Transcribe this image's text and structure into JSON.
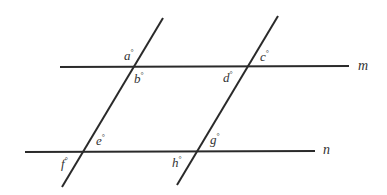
{
  "diagram": {
    "parallel_lines": [
      {
        "name": "m",
        "label": "m"
      },
      {
        "name": "n",
        "label": "n"
      }
    ],
    "transversals": [
      {
        "name": "left-transversal"
      },
      {
        "name": "right-transversal"
      }
    ],
    "angles": [
      {
        "label": "a",
        "unit": "°",
        "intersection": "left-transversal ∩ m",
        "position": "above-left"
      },
      {
        "label": "b",
        "unit": "°",
        "intersection": "left-transversal ∩ m",
        "position": "below-right"
      },
      {
        "label": "c",
        "unit": "°",
        "intersection": "right-transversal ∩ m",
        "position": "above-right"
      },
      {
        "label": "d",
        "unit": "°",
        "intersection": "right-transversal ∩ m",
        "position": "below-left"
      },
      {
        "label": "e",
        "unit": "°",
        "intersection": "left-transversal ∩ n",
        "position": "above-right"
      },
      {
        "label": "f",
        "unit": "°",
        "intersection": "left-transversal ∩ n",
        "position": "below-left"
      },
      {
        "label": "g",
        "unit": "°",
        "intersection": "right-transversal ∩ n",
        "position": "above-right"
      },
      {
        "label": "h",
        "unit": "°",
        "intersection": "right-transversal ∩ n",
        "position": "below-left"
      }
    ]
  }
}
